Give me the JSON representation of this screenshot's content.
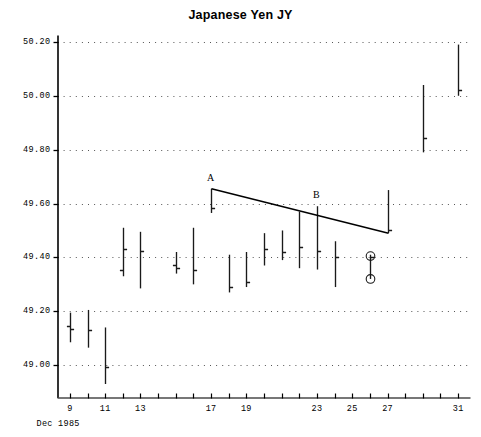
{
  "chart_data": {
    "type": "ohlc",
    "title": "Japanese Yen JY",
    "xlabel": "Dec 1985",
    "ylabel": "",
    "xlim": [
      8.3,
      31.7
    ],
    "ylim": [
      48.88,
      50.22
    ],
    "grid": true,
    "legend": null,
    "y_ticks": [
      {
        "value": 49.0,
        "label": "49.00"
      },
      {
        "value": 49.2,
        "label": "49.20"
      },
      {
        "value": 49.4,
        "label": "49.40"
      },
      {
        "value": 49.6,
        "label": "49.60"
      },
      {
        "value": 49.8,
        "label": "49.80"
      },
      {
        "value": 50.0,
        "label": "50.00"
      },
      {
        "value": 50.2,
        "label": "50.20"
      }
    ],
    "x_ticks": [
      {
        "value": 9,
        "label": "9"
      },
      {
        "value": 10,
        "label": ""
      },
      {
        "value": 11,
        "label": "11"
      },
      {
        "value": 12,
        "label": ""
      },
      {
        "value": 13,
        "label": "13"
      },
      {
        "value": 14,
        "label": ""
      },
      {
        "value": 15,
        "label": ""
      },
      {
        "value": 16,
        "label": ""
      },
      {
        "value": 17,
        "label": "17"
      },
      {
        "value": 18,
        "label": ""
      },
      {
        "value": 19,
        "label": "19"
      },
      {
        "value": 20,
        "label": ""
      },
      {
        "value": 21,
        "label": ""
      },
      {
        "value": 22,
        "label": ""
      },
      {
        "value": 23,
        "label": "23"
      },
      {
        "value": 24,
        "label": ""
      },
      {
        "value": 25,
        "label": "25"
      },
      {
        "value": 26,
        "label": ""
      },
      {
        "value": 27,
        "label": "27"
      },
      {
        "value": 28,
        "label": ""
      },
      {
        "value": 29,
        "label": ""
      },
      {
        "value": 30,
        "label": ""
      },
      {
        "value": 31,
        "label": "31"
      }
    ],
    "bars": [
      {
        "x": 9,
        "high": 49.195,
        "low": 49.085,
        "open": 49.145,
        "close": 49.135
      },
      {
        "x": 10,
        "high": 49.205,
        "low": 49.065,
        "open": null,
        "close": 49.13
      },
      {
        "x": 11,
        "high": 49.14,
        "low": 48.93,
        "open": null,
        "close": 48.995
      },
      {
        "x": 12,
        "high": 49.51,
        "low": 49.33,
        "open": 49.355,
        "close": 49.43
      },
      {
        "x": 13,
        "high": 49.495,
        "low": 49.285,
        "open": null,
        "close": 49.425
      },
      {
        "x": 15,
        "high": 49.42,
        "low": 49.34,
        "open": 49.37,
        "close": 49.36
      },
      {
        "x": 16,
        "high": 49.51,
        "low": 49.3,
        "open": null,
        "close": 49.355
      },
      {
        "x": 17,
        "high": 49.655,
        "low": 49.565,
        "open": null,
        "close": 49.585
      },
      {
        "x": 18,
        "high": 49.41,
        "low": 49.27,
        "open": null,
        "close": 49.29
      },
      {
        "x": 19,
        "high": 49.42,
        "low": 49.29,
        "open": null,
        "close": 49.31
      },
      {
        "x": 20,
        "high": 49.49,
        "low": 49.37,
        "open": null,
        "close": 49.43
      },
      {
        "x": 21,
        "high": 49.5,
        "low": 49.39,
        "open": null,
        "close": 49.42
      },
      {
        "x": 22,
        "high": 49.57,
        "low": 49.36,
        "open": null,
        "close": 49.44
      },
      {
        "x": 23,
        "high": 49.59,
        "low": 49.355,
        "open": null,
        "close": 49.425
      },
      {
        "x": 24,
        "high": 49.46,
        "low": 49.29,
        "open": null,
        "close": 49.4
      },
      {
        "x": 26,
        "high": 49.41,
        "low": 49.32,
        "open": null,
        "close": 49.4
      },
      {
        "x": 27,
        "high": 49.65,
        "low": 49.49,
        "open": null,
        "close": 49.5
      },
      {
        "x": 29,
        "high": 50.04,
        "low": 49.79,
        "open": null,
        "close": 49.845
      },
      {
        "x": 31,
        "high": 50.19,
        "low": 50.0,
        "open": null,
        "close": 50.02
      }
    ],
    "markers": [
      {
        "x": 26,
        "value": 49.405,
        "shape": "circle"
      },
      {
        "x": 26,
        "value": 49.32,
        "shape": "circle"
      }
    ],
    "annotations": [
      {
        "label": "A",
        "x": 17,
        "y": 49.655
      },
      {
        "label": "B",
        "x": 23,
        "y": 49.59
      }
    ],
    "trendlines": [
      {
        "name": "downtrend-A-to-B",
        "points": [
          {
            "x": 17,
            "y": 49.655
          },
          {
            "x": 27,
            "y": 49.49
          }
        ]
      }
    ]
  }
}
